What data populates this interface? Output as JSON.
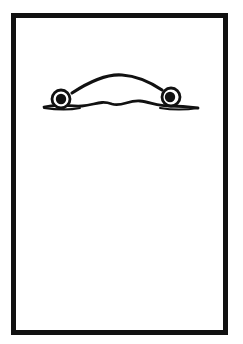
{
  "figure": {
    "colors": {
      "stroke": "#111111",
      "background": "#ffffff"
    }
  }
}
